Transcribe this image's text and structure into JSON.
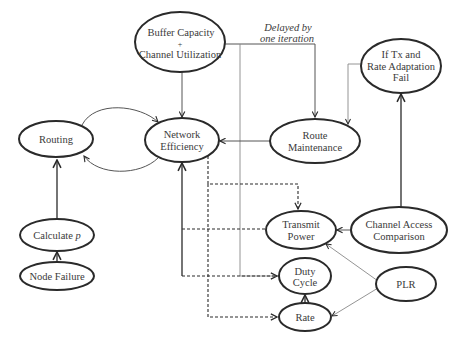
{
  "diagram": {
    "nodes": {
      "buffer": {
        "line1": "Buffer Capacity",
        "line2": "+",
        "line3": "Channel Utilization"
      },
      "iftx": {
        "line1": "If Tx and",
        "line2": "Rate Adaptation",
        "line3": "Fail"
      },
      "routing": {
        "label": "Routing"
      },
      "neteff": {
        "line1": "Network",
        "line2": "Efficiency"
      },
      "routemaint": {
        "line1": "Route",
        "line2": "Maintenance"
      },
      "calcp": {
        "label": "Calculate ",
        "var": "p"
      },
      "nodefail": {
        "label": "Node Failure"
      },
      "txpower": {
        "line1": "Transmit",
        "line2": "Power"
      },
      "chanaccess": {
        "line1": "Channel Access",
        "line2": "Comparison"
      },
      "duty": {
        "line1": "Duty",
        "line2": "Cycle"
      },
      "plr": {
        "label": "PLR"
      },
      "rate": {
        "label": "Rate"
      }
    },
    "annotations": {
      "delayed": {
        "line1": "Delayed by",
        "line2": "one iteration"
      }
    },
    "edges": [
      {
        "from": "Buffer Capacity + Channel Utilization",
        "to": "Network Efficiency",
        "style": "solid"
      },
      {
        "from": "Buffer Capacity + Channel Utilization",
        "to": "Route Maintenance",
        "style": "solid",
        "note": "Delayed by one iteration"
      },
      {
        "from": "Buffer Capacity + Channel Utilization",
        "to": "Duty Cycle",
        "style": "solid-thin"
      },
      {
        "from": "If Tx and Rate Adaptation Fail",
        "to": "Route Maintenance",
        "style": "solid-thin"
      },
      {
        "from": "Route Maintenance",
        "to": "Network Efficiency",
        "style": "solid"
      },
      {
        "from": "Routing",
        "to": "Network Efficiency",
        "style": "curved"
      },
      {
        "from": "Network Efficiency",
        "to": "Routing",
        "style": "curved"
      },
      {
        "from": "Calculate p",
        "to": "Routing",
        "style": "solid"
      },
      {
        "from": "Node Failure",
        "to": "Calculate p",
        "style": "solid"
      },
      {
        "from": "Channel Access Comparison",
        "to": "If Tx and Rate Adaptation Fail",
        "style": "solid"
      },
      {
        "from": "Channel Access Comparison",
        "to": "Transmit Power",
        "style": "solid"
      },
      {
        "from": "PLR",
        "to": "Transmit Power",
        "style": "solid-thin"
      },
      {
        "from": "PLR",
        "to": "Rate",
        "style": "solid-thin"
      },
      {
        "from": "Rate",
        "to": "Duty Cycle",
        "style": "solid"
      },
      {
        "from": "Network Efficiency",
        "to": "Transmit Power",
        "style": "dashed"
      },
      {
        "from": "Network Efficiency",
        "to": "Rate",
        "style": "dashed"
      },
      {
        "from": "Transmit Power",
        "to": "Network Efficiency",
        "style": "dashed"
      },
      {
        "from": "Network Efficiency",
        "to": "Duty Cycle",
        "style": "dashed"
      }
    ]
  }
}
